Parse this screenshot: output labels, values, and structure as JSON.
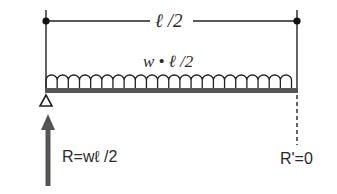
{
  "diagram": {
    "span_label": "ℓ /2",
    "load_label": "w • ℓ /2",
    "left_reaction_label": "R=wℓ /2",
    "right_reaction_label": "R'=0",
    "colors": {
      "line": "#222222",
      "beam": "#555555",
      "arrow": "#555555"
    },
    "elements": [
      "dimension line spanning ℓ/2 with dot endpoints",
      "uniformly distributed load (arches) w over ℓ/2",
      "beam",
      "pin support (triangle) at left",
      "upward reaction arrow at left",
      "dashed line at right end (zero reaction)"
    ]
  }
}
